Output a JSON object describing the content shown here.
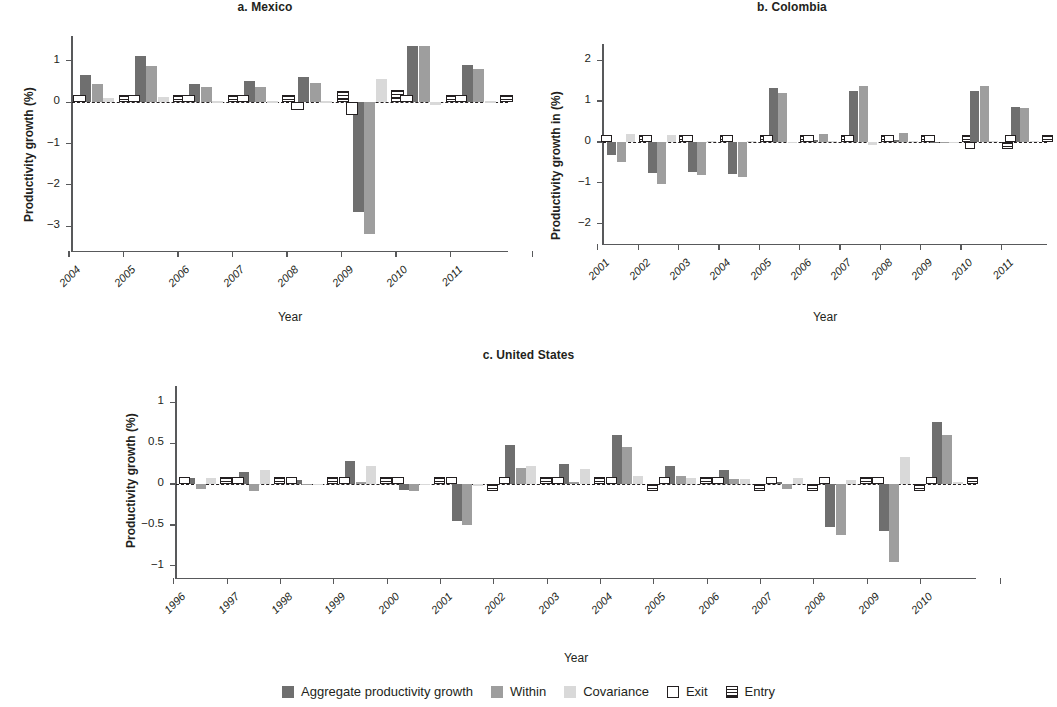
{
  "figure": {
    "background": "#ffffff",
    "colors": {
      "aggregate": "#6f6f6f",
      "within": "#9e9e9e",
      "covariance": "#d9d9d9",
      "outline": "#231f20",
      "axis": "#58595b"
    }
  },
  "legend": {
    "items": [
      {
        "label": "Aggregate productivity growth",
        "swatch": "solid",
        "color": "#6f6f6f"
      },
      {
        "label": "Within",
        "swatch": "solid",
        "color": "#9e9e9e"
      },
      {
        "label": "Covariance",
        "swatch": "solid",
        "color": "#d9d9d9"
      },
      {
        "label": "Exit",
        "swatch": "open",
        "color": "#ffffff"
      },
      {
        "label": "Entry",
        "swatch": "lined",
        "color": "#ffffff"
      }
    ]
  },
  "chart_data": [
    {
      "type": "bar",
      "panel": "a",
      "title": "a. Mexico",
      "xlabel": "Year",
      "ylabel": "Productivity growth (%)",
      "ylim": [
        -3.6,
        1.6
      ],
      "yticks": [
        1,
        0,
        -1,
        -2,
        -3
      ],
      "ytick_labels": [
        "1",
        "0",
        "−1",
        "−2",
        "−3"
      ],
      "grid": false,
      "legend_position": "figure-bottom",
      "categories": [
        "2004",
        "2005",
        "2006",
        "2007",
        "2008",
        "2009",
        "2010",
        "2011"
      ],
      "series": [
        {
          "name": "Aggregate productivity growth",
          "values": [
            0.66,
            1.12,
            0.44,
            0.5,
            0.6,
            -2.65,
            1.36,
            0.9
          ]
        },
        {
          "name": "Within",
          "values": [
            0.44,
            0.88,
            0.36,
            0.37,
            0.46,
            -3.2,
            1.36,
            0.8
          ]
        },
        {
          "name": "Covariance",
          "values": [
            0.1,
            0.12,
            0.02,
            0.02,
            0.02,
            0.56,
            -0.08,
            0.02
          ]
        },
        {
          "name": "Exit",
          "values": [
            0.02,
            0.02,
            0.02,
            0.02,
            -0.2,
            -0.3,
            0.08,
            0.03
          ]
        },
        {
          "name": "Entry",
          "values": [
            0.01,
            0.01,
            0.01,
            0.01,
            0.28,
            0.3,
            0.02,
            0.01
          ]
        }
      ]
    },
    {
      "type": "bar",
      "panel": "b",
      "title": "b. Colombia",
      "xlabel": "Year",
      "ylabel": "Productivity growth in (%)",
      "ylim": [
        -2.5,
        2.4
      ],
      "yticks": [
        2,
        1,
        0,
        -1,
        -2
      ],
      "ytick_labels": [
        "2",
        "1",
        "0",
        "−1",
        "−2"
      ],
      "grid": false,
      "legend_position": "figure-bottom",
      "categories": [
        "2001",
        "2002",
        "2003",
        "2004",
        "2005",
        "2006",
        "2007",
        "2008",
        "2009",
        "2010",
        "2011"
      ],
      "series": [
        {
          "name": "Aggregate productivity growth",
          "values": [
            -0.32,
            -0.76,
            -0.74,
            -0.78,
            1.32,
            0.06,
            1.24,
            0.05,
            0.0,
            1.24,
            0.86
          ]
        },
        {
          "name": "Within",
          "values": [
            -0.5,
            -1.02,
            -0.82,
            -0.85,
            1.2,
            0.2,
            1.36,
            0.22,
            0.0,
            1.38,
            0.82
          ]
        },
        {
          "name": "Covariance",
          "values": [
            0.2,
            0.16,
            0.02,
            0.02,
            -0.02,
            0.02,
            -0.08,
            0.02,
            0.0,
            0.02,
            0.02
          ]
        },
        {
          "name": "Exit",
          "values": [
            0.08,
            0.02,
            0.02,
            0.02,
            0.06,
            0.04,
            0.08,
            0.03,
            0.0,
            -0.14,
            0.03
          ]
        },
        {
          "name": "Entry",
          "values": [
            0.09,
            0.01,
            0.01,
            0.01,
            0.03,
            0.02,
            0.05,
            0.02,
            0.0,
            -0.1,
            0.02
          ]
        }
      ]
    },
    {
      "type": "bar",
      "panel": "c",
      "title": "c. United States",
      "xlabel": "Year",
      "ylabel": "Productivity growth (%)",
      "ylim": [
        -1.15,
        1.2
      ],
      "yticks": [
        1,
        0.5,
        0,
        -0.5,
        -1
      ],
      "ytick_labels": [
        "1",
        "0.5",
        "0",
        "−0.5",
        "−1"
      ],
      "grid": false,
      "legend_position": "figure-bottom",
      "categories": [
        "1996",
        "1997",
        "1998",
        "1999",
        "2000",
        "2001",
        "2002",
        "2003",
        "2004",
        "2005",
        "2006",
        "2007",
        "2008",
        "2009",
        "2010"
      ],
      "series": [
        {
          "name": "Aggregate productivity growth",
          "values": [
            0.08,
            0.15,
            0.05,
            0.28,
            -0.07,
            -0.45,
            0.48,
            0.25,
            0.6,
            0.22,
            0.17,
            0.02,
            -0.52,
            -0.57,
            0.76
          ]
        },
        {
          "name": "Within",
          "values": [
            -0.06,
            -0.08,
            0.0,
            0.02,
            -0.08,
            -0.5,
            0.2,
            0.02,
            0.45,
            0.1,
            0.06,
            -0.06,
            -0.62,
            -0.95,
            0.6
          ]
        },
        {
          "name": "Covariance",
          "values": [
            0.07,
            0.17,
            0.0,
            0.22,
            0.0,
            -0.03,
            0.22,
            0.18,
            0.1,
            0.07,
            0.06,
            0.08,
            0.05,
            0.33,
            0.03
          ]
        },
        {
          "name": "Exit",
          "values": [
            0.0,
            0.04,
            0.07,
            0.05,
            0.05,
            0.04,
            0.07,
            0.05,
            0.06,
            0.05,
            0.04,
            0.06,
            0.06,
            0.07,
            0.04
          ]
        },
        {
          "name": "Entry",
          "values": [
            0.0,
            0.01,
            0.0,
            0.0,
            0.01,
            -0.02,
            0.01,
            0.01,
            -0.05,
            0.0,
            -0.01,
            -0.01,
            0.0,
            -0.02,
            0.0
          ]
        }
      ]
    }
  ]
}
